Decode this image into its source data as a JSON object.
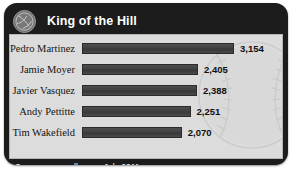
{
  "widget": {
    "title": "King of the Hill",
    "icon": "baseball-icon",
    "frame_color": "#1c1c1c",
    "panel_color": "#dcdcdc",
    "bar_color": "#414141"
  },
  "chart_data": {
    "type": "bar",
    "orientation": "horizontal",
    "title": "King of the Hill",
    "categories": [
      "Pedro Martinez",
      "Jamie Moyer",
      "Javier Vasquez",
      "Andy Pettitte",
      "Tim Wakefield"
    ],
    "values": [
      3154,
      2405,
      2388,
      2251,
      2070
    ],
    "value_labels": [
      "3,154",
      "2,405",
      "2,388",
      "2,251",
      "2,070"
    ],
    "xlabel": "",
    "ylabel": "",
    "xlim": [
      0,
      3154
    ],
    "grid": false,
    "legend": false
  },
  "rows": [
    {
      "label": "Pedro Martinez",
      "value": "3,154",
      "pct": 100
    },
    {
      "label": "Jamie Moyer",
      "value": "2,405",
      "pct": 76.3
    },
    {
      "label": "Javier Vasquez",
      "value": "2,388",
      "pct": 75.7
    },
    {
      "label": "Andy Pettitte",
      "value": "2,251",
      "pct": 71.4
    },
    {
      "label": "Tim Wakefield",
      "value": "2,070",
      "pct": 65.6
    }
  ],
  "footer": {
    "source": "Source: www.mlb.com, July 2011"
  }
}
